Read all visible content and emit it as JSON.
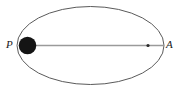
{
  "figure": {
    "type": "orbit-diagram",
    "width": 181,
    "height": 92,
    "background_color": "#ffffff"
  },
  "labels": {
    "perihelion": "P",
    "aphelion": "A"
  },
  "colors": {
    "orbit_stroke": "#5a5a5a",
    "axis_line": "#9a9a9a",
    "body_fill": "#141414",
    "focus_dot": "#2b2b2b",
    "label_text": "#1a1a1a"
  },
  "geometry": {
    "ellipse": {
      "center_x": 90.5,
      "center_y": 45.5,
      "semi_major_axis": 73.5,
      "semi_minor_axis": 39.0,
      "stroke_width": 1
    },
    "major_axis_line": {
      "x1": 35,
      "y1": 45.5,
      "x2": 164,
      "y2": 45.5,
      "stroke_width": 1.6
    },
    "central_body": {
      "center_x": 27.5,
      "center_y": 45.5,
      "radius": 8.8
    },
    "focus_marker": {
      "center_x": 148,
      "center_y": 45.5,
      "radius": 1.6
    }
  }
}
